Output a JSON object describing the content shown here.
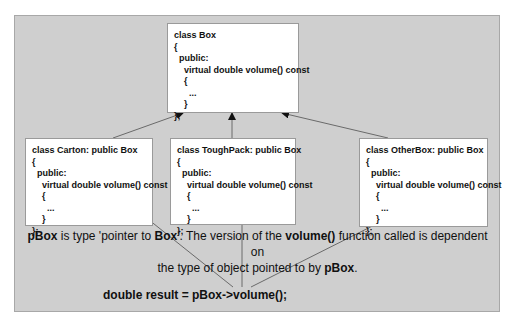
{
  "diagram": {
    "base_class": {
      "lines": [
        "class Box",
        "{",
        "  public:",
        "    virtual double volume() const",
        "    {",
        "      ...",
        "    }",
        "};"
      ]
    },
    "derived_classes": [
      {
        "name": "Carton",
        "lines": [
          "class Carton: public Box",
          "{",
          "  public:",
          "    virtual double volume() const",
          "    {",
          "      ...",
          "    }",
          "};"
        ]
      },
      {
        "name": "ToughPack",
        "lines": [
          "class ToughPack: public Box",
          "{",
          "  public:",
          "    virtual double volume() const",
          "    {",
          "      ...",
          "    }",
          "};"
        ]
      },
      {
        "name": "OtherBox",
        "lines": [
          "class OtherBox: public Box",
          "{",
          "  public:",
          "    virtual double volume() const",
          "    {",
          "      ...",
          "    }",
          "};"
        ]
      }
    ],
    "caption": {
      "pbox1": "pBox",
      "part1": " is type 'pointer to ",
      "box": "Box",
      "part2": "'. The version of the ",
      "volume": "volume()",
      "part3": " function called is dependent on",
      "line2": "the type of object pointed to by ",
      "pbox2": "pBox",
      "end": "."
    },
    "statement": "double result = pBox->volume();",
    "colors": {
      "panel": "#cfcfcf",
      "box_fill": "#ffffff",
      "line": "#6a6a6a",
      "text": "#111111"
    }
  }
}
